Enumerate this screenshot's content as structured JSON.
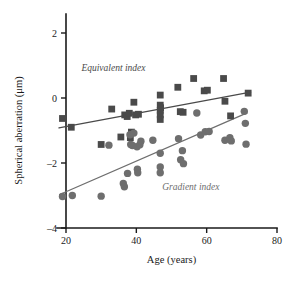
{
  "chart_data": {
    "type": "scatter",
    "title": "",
    "xlabel": "Age (years)",
    "ylabel": "Spherical aberration (μm)",
    "xlim": [
      15,
      80
    ],
    "ylim": [
      -4,
      3
    ],
    "xticks": [
      20,
      40,
      60,
      80
    ],
    "yticks": [
      2,
      0,
      -2,
      -4
    ],
    "xtick_labels": [
      "20",
      "40",
      "60",
      "80"
    ],
    "ytick_labels": [
      "2",
      "0",
      "–2",
      "–4"
    ],
    "grid": false,
    "legend_position": "inline-annotation",
    "series": [
      {
        "name": "Equivalent index",
        "marker": "square",
        "color": "#4a4a4a",
        "annotation": "Equivalent index",
        "annotation_x": 33.5,
        "annotation_y": 0.82,
        "fit_line": {
          "x0": 18.0,
          "y0": -0.92,
          "x1": 72.5,
          "y1": 0.18
        },
        "points": [
          [
            19.0,
            -0.63
          ],
          [
            21.5,
            -0.9
          ],
          [
            30.0,
            -1.43
          ],
          [
            33.0,
            -0.34
          ],
          [
            36.7,
            -0.52
          ],
          [
            37.4,
            -0.57
          ],
          [
            38.0,
            -0.47
          ],
          [
            39.3,
            -0.13
          ],
          [
            39.8,
            -0.52
          ],
          [
            40.6,
            -0.5
          ],
          [
            38.6,
            -1.05
          ],
          [
            38.3,
            -1.22
          ],
          [
            46.8,
            0.09
          ],
          [
            46.8,
            -0.22
          ],
          [
            46.8,
            -0.38
          ],
          [
            46.8,
            -0.52
          ],
          [
            46.8,
            -0.66
          ],
          [
            46.9,
            -0.3
          ],
          [
            51.8,
            0.33
          ],
          [
            52.5,
            -0.42
          ],
          [
            53.3,
            -0.44
          ],
          [
            56.3,
            0.6
          ],
          [
            59.3,
            0.22
          ],
          [
            60.2,
            0.24
          ],
          [
            64.8,
            0.6
          ],
          [
            65.2,
            -0.1
          ],
          [
            66.8,
            -0.55
          ],
          [
            71.8,
            0.15
          ],
          [
            35.6,
            -1.2
          ]
        ]
      },
      {
        "name": "Gradient index",
        "marker": "circle",
        "color": "#6e6e6e",
        "annotation": "Gradient index",
        "annotation_x": 55.5,
        "annotation_y": -2.82,
        "fit_line": {
          "x0": 18.2,
          "y0": -2.97,
          "x1": 71.5,
          "y1": -0.46
        },
        "points": [
          [
            19.0,
            -3.03
          ],
          [
            21.8,
            -3.0
          ],
          [
            30.0,
            -3.02
          ],
          [
            32.2,
            -1.45
          ],
          [
            36.3,
            -2.63
          ],
          [
            36.6,
            -2.73
          ],
          [
            37.5,
            -2.32
          ],
          [
            38.2,
            -1.13
          ],
          [
            38.4,
            -1.43
          ],
          [
            38.9,
            -1.46
          ],
          [
            39.3,
            -1.08
          ],
          [
            40.2,
            -1.5
          ],
          [
            40.3,
            -2.19
          ],
          [
            40.4,
            -2.3
          ],
          [
            41.0,
            -1.44
          ],
          [
            41.3,
            -1.33
          ],
          [
            44.7,
            -1.3
          ],
          [
            46.8,
            -1.7
          ],
          [
            46.8,
            -2.12
          ],
          [
            46.8,
            -2.3
          ],
          [
            52.0,
            -1.25
          ],
          [
            52.6,
            -1.9
          ],
          [
            53.4,
            -2.02
          ],
          [
            53.1,
            -1.62
          ],
          [
            58.3,
            -1.14
          ],
          [
            59.6,
            -1.04
          ],
          [
            60.7,
            -1.03
          ],
          [
            65.2,
            -1.3
          ],
          [
            66.6,
            -1.22
          ],
          [
            67.0,
            -1.32
          ],
          [
            70.7,
            -0.41
          ],
          [
            71.0,
            -0.78
          ],
          [
            71.2,
            -1.42
          ],
          [
            57.2,
            -0.46
          ]
        ]
      }
    ]
  }
}
